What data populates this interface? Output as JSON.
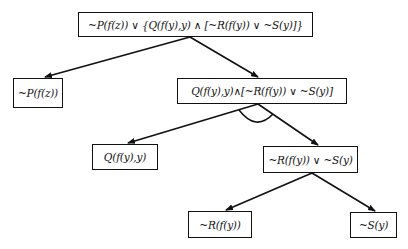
{
  "diagram": {
    "type": "and-or-tree",
    "nodes": {
      "root": "~P(f(z)) ∨ {Q(f(y),y) ∧ [~R(f(y)) ∨ ~S(y)]}",
      "left": "~P(f(z))",
      "right": "Q(f(y),y)∧[~R(f(y)) ∨ ~S(y)]",
      "q": "Q(f(y),y)",
      "rs": "~R(f(y)) ∨ ~S(y)",
      "r": "~R(f(y))",
      "s": "~S(y)"
    },
    "edges": [
      {
        "from": "root",
        "to": "left"
      },
      {
        "from": "root",
        "to": "right"
      },
      {
        "from": "right",
        "to": "q",
        "and_connector": true
      },
      {
        "from": "right",
        "to": "rs",
        "and_connector": true
      },
      {
        "from": "rs",
        "to": "r"
      },
      {
        "from": "rs",
        "to": "s"
      }
    ],
    "colors": {
      "line": "#111111",
      "background": "#ffffff"
    }
  }
}
